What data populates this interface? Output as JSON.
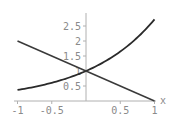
{
  "chart_data": {
    "type": "line",
    "title": "",
    "xlabel": "x",
    "ylabel": "",
    "xlim": [
      -1,
      1
    ],
    "ylim": [
      0,
      2.72
    ],
    "grid": false,
    "legend": null,
    "x_ticks": [
      "-1",
      "-0.5",
      "0.5",
      "1"
    ],
    "y_ticks": [
      "0.5",
      "1",
      "1.5",
      "2",
      "2.5"
    ],
    "x": [
      -1,
      -0.5,
      0,
      0.5,
      1
    ],
    "series": [
      {
        "name": "exp(x)",
        "values": [
          0.368,
          0.607,
          1.0,
          1.649,
          2.718
        ]
      },
      {
        "name": "1 - x",
        "values": [
          2.0,
          1.5,
          1.0,
          0.5,
          0.0
        ]
      }
    ]
  },
  "colors": {
    "curve": "#2a2a2a",
    "axis": "#b0b0b0",
    "tick_text": "#8a8a8a"
  }
}
